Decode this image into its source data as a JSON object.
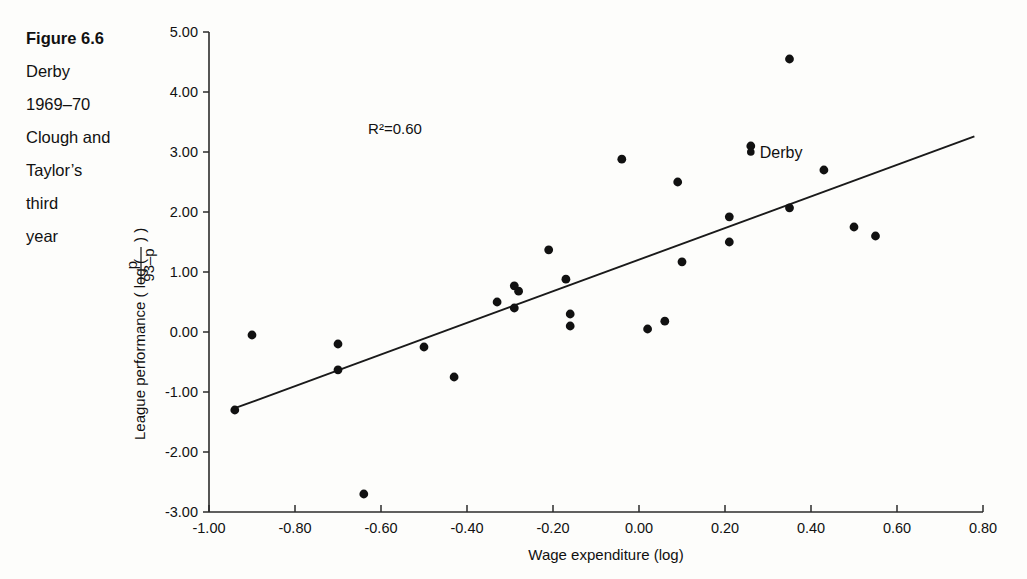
{
  "caption": {
    "figure_number": "Figure 6.6",
    "lines": [
      "Derby",
      "1969–70",
      "Clough and",
      "Taylor’s",
      "third",
      "year"
    ]
  },
  "chart_data": {
    "type": "scatter",
    "title": "",
    "xlabel": "Wage expenditure (log)",
    "ylabel_prefix": "League performance ( log (",
    "ylabel_numerator": "p",
    "ylabel_denominator": "93–p",
    "ylabel_suffix": ") )",
    "xlim": [
      -1.0,
      0.8
    ],
    "ylim": [
      -3.0,
      5.0
    ],
    "xticks": [
      "-1.00",
      "-0.80",
      "-0.60",
      "-0.40",
      "-0.20",
      "0.00",
      "0.20",
      "0.40",
      "0.60",
      "0.80"
    ],
    "xtick_values": [
      -1.0,
      -0.8,
      -0.6,
      -0.4,
      -0.2,
      0.0,
      0.2,
      0.4,
      0.6,
      0.8
    ],
    "yticks": [
      "5.00",
      "4.00",
      "3.00",
      "2.00",
      "1.00",
      "0.00",
      "-1.00",
      "-2.00",
      "-3.00"
    ],
    "ytick_values": [
      5.0,
      4.0,
      3.0,
      2.0,
      1.0,
      0.0,
      -1.0,
      -2.0,
      -3.0
    ],
    "grid": false,
    "legend": "none",
    "annotations": [
      {
        "name": "r-squared",
        "text": "R²=0.60",
        "x": -0.63,
        "y": 3.3
      }
    ],
    "point_labels": [
      {
        "name": "derby",
        "text": "Derby",
        "x": 0.26,
        "y": 3.0
      }
    ],
    "trendline": {
      "x0": -0.94,
      "y0": -1.27,
      "x1": 0.78,
      "y1": 3.26,
      "r_squared": 0.6
    },
    "points": [
      {
        "x": -0.94,
        "y": -1.3
      },
      {
        "x": -0.9,
        "y": -0.05
      },
      {
        "x": -0.7,
        "y": -0.2
      },
      {
        "x": -0.7,
        "y": -0.63
      },
      {
        "x": -0.64,
        "y": -2.7
      },
      {
        "x": -0.5,
        "y": -0.25
      },
      {
        "x": -0.43,
        "y": -0.75
      },
      {
        "x": -0.33,
        "y": 0.5
      },
      {
        "x": -0.29,
        "y": 0.77
      },
      {
        "x": -0.28,
        "y": 0.68
      },
      {
        "x": -0.29,
        "y": 0.4
      },
      {
        "x": -0.21,
        "y": 1.37
      },
      {
        "x": -0.17,
        "y": 0.88
      },
      {
        "x": -0.16,
        "y": 0.3
      },
      {
        "x": -0.16,
        "y": 0.1
      },
      {
        "x": -0.04,
        "y": 2.88
      },
      {
        "x": 0.02,
        "y": 0.05
      },
      {
        "x": 0.06,
        "y": 0.18
      },
      {
        "x": 0.09,
        "y": 2.5
      },
      {
        "x": 0.1,
        "y": 1.17
      },
      {
        "x": 0.21,
        "y": 1.92
      },
      {
        "x": 0.21,
        "y": 1.5
      },
      {
        "x": 0.26,
        "y": 3.1
      },
      {
        "x": 0.35,
        "y": 4.55
      },
      {
        "x": 0.35,
        "y": 2.07
      },
      {
        "x": 0.43,
        "y": 2.7
      },
      {
        "x": 0.5,
        "y": 1.75
      },
      {
        "x": 0.55,
        "y": 1.6
      }
    ]
  }
}
